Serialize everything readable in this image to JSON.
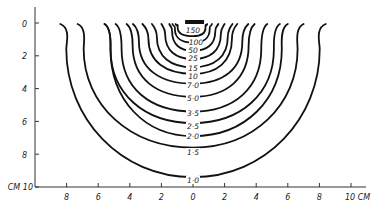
{
  "chart_data": {
    "type": "line",
    "title": "",
    "subtitle": "Isodose curves (percent depth dose) around a surface source",
    "xlabel": "CM",
    "ylabel": "CM",
    "x_ticks": [
      "8",
      "6",
      "4",
      "2",
      "0",
      "2",
      "4",
      "6",
      "8",
      "10"
    ],
    "x_tick_values_cm": [
      -8,
      -6,
      -4,
      -2,
      0,
      2,
      4,
      6,
      8,
      10
    ],
    "y_ticks": [
      "0",
      "2",
      "4",
      "6",
      "8",
      "10"
    ],
    "y_tick_values_cm": [
      0,
      2,
      4,
      6,
      8,
      10
    ],
    "x_axis_label": "10 CM",
    "y_axis_label": "CM 10",
    "xlim": [
      -10,
      11
    ],
    "ylim": [
      0,
      10
    ],
    "grid": false,
    "legend": "none",
    "source": {
      "label": "source",
      "x_cm": [
        -0.5,
        0.7
      ],
      "depth_cm": 0
    },
    "series": [
      {
        "name": "150",
        "label": "150",
        "left_top_cm": -1.1,
        "right_top_cm": 0.9,
        "depth_at_center_cm": 0.8
      },
      {
        "name": "100",
        "label": "100",
        "left_top_cm": -1.3,
        "right_top_cm": 1.2,
        "depth_at_center_cm": 1.2
      },
      {
        "name": "50",
        "label": "50",
        "left_top_cm": -1.5,
        "right_top_cm": 1.6,
        "depth_at_center_cm": 1.7
      },
      {
        "name": "25",
        "label": "25",
        "left_top_cm": -2.0,
        "right_top_cm": 2.0,
        "depth_at_center_cm": 2.2
      },
      {
        "name": "15",
        "label": "15",
        "left_top_cm": -2.6,
        "right_top_cm": 2.5,
        "depth_at_center_cm": 2.7
      },
      {
        "name": "10",
        "label": "10",
        "left_top_cm": -3.2,
        "right_top_cm": 2.8,
        "depth_at_center_cm": 3.1
      },
      {
        "name": "7.0",
        "label": "7·0",
        "left_top_cm": -3.8,
        "right_top_cm": 3.5,
        "depth_at_center_cm": 3.7
      },
      {
        "name": "5.0",
        "label": "5·0",
        "left_top_cm": -4.2,
        "right_top_cm": 3.9,
        "depth_at_center_cm": 4.5
      },
      {
        "name": "3.5",
        "label": "3·5",
        "left_top_cm": -4.9,
        "right_top_cm": 4.7,
        "depth_at_center_cm": 5.4
      },
      {
        "name": "2.5",
        "label": "2·5",
        "left_top_cm": -5.6,
        "right_top_cm": 5.5,
        "depth_at_center_cm": 6.1
      },
      {
        "name": "2.0",
        "label": "2·0",
        "left_top_cm": -5.6,
        "right_top_cm": 6.0,
        "depth_at_center_cm": 6.9
      },
      {
        "name": "1.5",
        "label": "1·5",
        "left_top_cm": -7.3,
        "right_top_cm": 7.0,
        "depth_at_center_cm": 7.6
      },
      {
        "name": "1.0",
        "label": "1·0",
        "left_top_cm": -8.4,
        "right_top_cm": 8.4,
        "depth_at_center_cm": 9.4
      }
    ],
    "layout": {
      "origin_px": [
        193,
        23
      ],
      "px_per_cm_x": 15.8,
      "px_per_cm_y": 16.4,
      "axis_y_px": 187,
      "axis_x_px": 35,
      "x_axis_end_px": 366,
      "y_axis_start_px": 7
    },
    "label_positions_px": [
      [
        193,
        33
      ],
      [
        196,
        45
      ],
      [
        193,
        53
      ],
      [
        193,
        61
      ],
      [
        193,
        71
      ],
      [
        193,
        79
      ],
      [
        193,
        88
      ],
      [
        193,
        101
      ],
      [
        193,
        116
      ],
      [
        193,
        129
      ],
      [
        193,
        139
      ],
      [
        193,
        155
      ],
      [
        193,
        183
      ]
    ]
  }
}
